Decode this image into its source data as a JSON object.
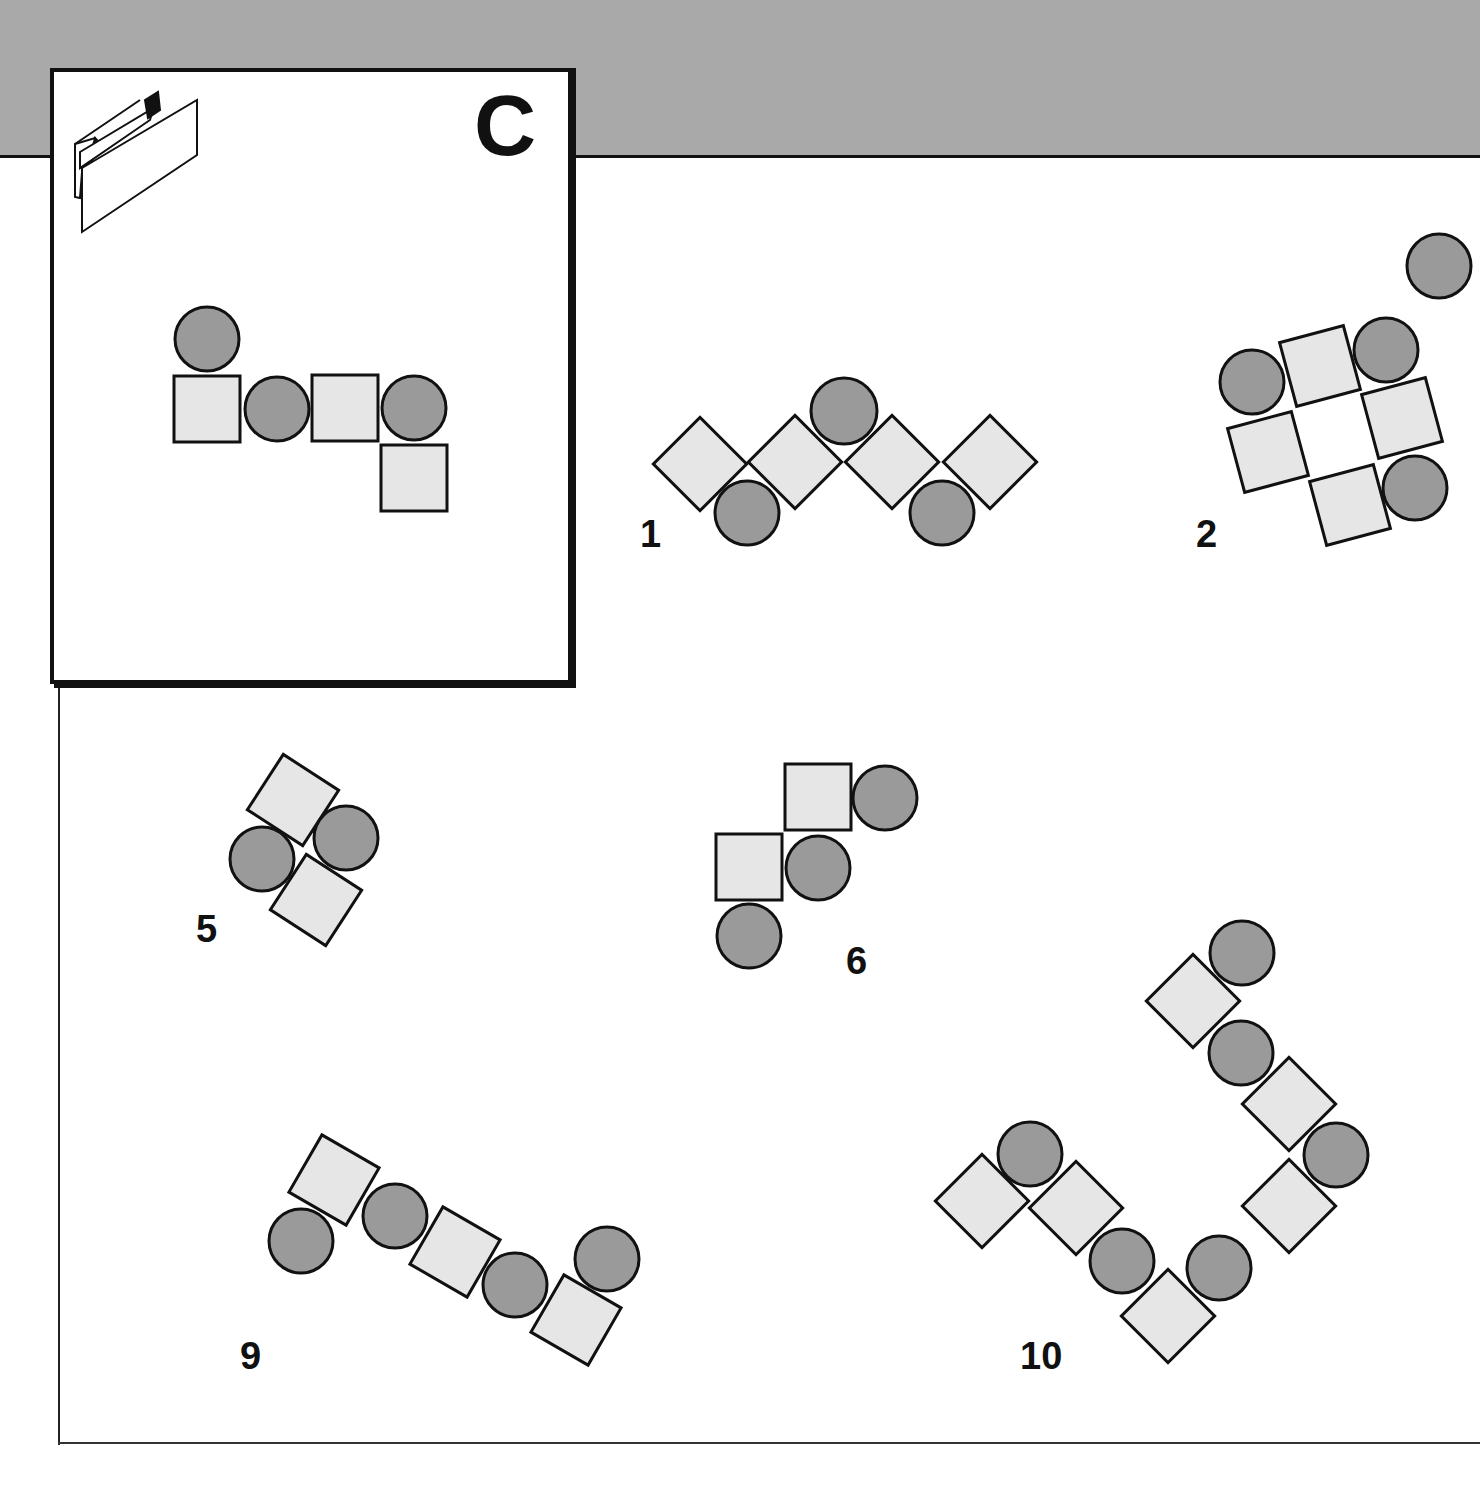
{
  "card": {
    "letter": "C",
    "fold_icon": "folded-paper-icon"
  },
  "colors": {
    "band": "#a9a9a9",
    "square_fill": "#e6e6e6",
    "circle_fill": "#9a9a9a",
    "stroke": "#111111"
  },
  "reference": {
    "shapes": [
      {
        "type": "circle",
        "cx": 207,
        "cy": 339,
        "r": 32
      },
      {
        "type": "square",
        "cx": 207,
        "cy": 409,
        "s": 66,
        "rot": 0
      },
      {
        "type": "circle",
        "cx": 277,
        "cy": 409,
        "r": 32
      },
      {
        "type": "square",
        "cx": 345,
        "cy": 408,
        "s": 66,
        "rot": 0
      },
      {
        "type": "circle",
        "cx": 414,
        "cy": 408,
        "r": 32
      },
      {
        "type": "square",
        "cx": 414,
        "cy": 478,
        "s": 66,
        "rot": 0
      }
    ]
  },
  "options": [
    {
      "label": "1",
      "label_x": 640,
      "label_y": 515,
      "shapes": [
        {
          "type": "square",
          "cx": 700,
          "cy": 464,
          "s": 66,
          "rot": 45
        },
        {
          "type": "circle",
          "cx": 747,
          "cy": 513,
          "r": 32
        },
        {
          "type": "square",
          "cx": 795,
          "cy": 462,
          "s": 66,
          "rot": 45
        },
        {
          "type": "circle",
          "cx": 844,
          "cy": 411,
          "r": 33
        },
        {
          "type": "square",
          "cx": 892,
          "cy": 462,
          "s": 66,
          "rot": 45
        },
        {
          "type": "circle",
          "cx": 942,
          "cy": 513,
          "r": 32
        },
        {
          "type": "square",
          "cx": 990,
          "cy": 462,
          "s": 66,
          "rot": 45
        }
      ]
    },
    {
      "label": "2",
      "label_x": 1196,
      "label_y": 515,
      "shapes": [
        {
          "type": "circle",
          "cx": 1439,
          "cy": 266,
          "r": 32
        },
        {
          "type": "circle",
          "cx": 1252,
          "cy": 382,
          "r": 32
        },
        {
          "type": "square",
          "cx": 1320,
          "cy": 366,
          "s": 66,
          "rot": -15
        },
        {
          "type": "circle",
          "cx": 1386,
          "cy": 350,
          "r": 32
        },
        {
          "type": "square",
          "cx": 1268,
          "cy": 452,
          "s": 66,
          "rot": -15
        },
        {
          "type": "square",
          "cx": 1402,
          "cy": 418,
          "s": 66,
          "rot": -15
        },
        {
          "type": "square",
          "cx": 1350,
          "cy": 505,
          "s": 66,
          "rot": -15
        },
        {
          "type": "circle",
          "cx": 1415,
          "cy": 488,
          "r": 32
        }
      ]
    },
    {
      "label": "5",
      "label_x": 196,
      "label_y": 910,
      "shapes": [
        {
          "type": "square",
          "cx": 293,
          "cy": 800,
          "s": 66,
          "rot": 33
        },
        {
          "type": "circle",
          "cx": 346,
          "cy": 838,
          "r": 32
        },
        {
          "type": "circle",
          "cx": 262,
          "cy": 859,
          "r": 32
        },
        {
          "type": "square",
          "cx": 316,
          "cy": 900,
          "s": 66,
          "rot": 33
        }
      ]
    },
    {
      "label": "6",
      "label_x": 846,
      "label_y": 942,
      "shapes": [
        {
          "type": "square",
          "cx": 818,
          "cy": 797,
          "s": 66,
          "rot": 0
        },
        {
          "type": "circle",
          "cx": 885,
          "cy": 798,
          "r": 32
        },
        {
          "type": "square",
          "cx": 749,
          "cy": 867,
          "s": 66,
          "rot": 0
        },
        {
          "type": "circle",
          "cx": 818,
          "cy": 868,
          "r": 32
        },
        {
          "type": "circle",
          "cx": 749,
          "cy": 936,
          "r": 32
        }
      ]
    },
    {
      "label": "9",
      "label_x": 240,
      "label_y": 1337,
      "shapes": [
        {
          "type": "square",
          "cx": 334,
          "cy": 1180,
          "s": 66,
          "rot": 30
        },
        {
          "type": "circle",
          "cx": 301,
          "cy": 1241,
          "r": 32
        },
        {
          "type": "circle",
          "cx": 395,
          "cy": 1216,
          "r": 32
        },
        {
          "type": "square",
          "cx": 455,
          "cy": 1252,
          "s": 66,
          "rot": 30
        },
        {
          "type": "circle",
          "cx": 515,
          "cy": 1285,
          "r": 32
        },
        {
          "type": "circle",
          "cx": 607,
          "cy": 1259,
          "r": 32
        },
        {
          "type": "square",
          "cx": 576,
          "cy": 1320,
          "s": 66,
          "rot": 30
        }
      ]
    },
    {
      "label": "10",
      "label_x": 1020,
      "label_y": 1337,
      "shapes": [
        {
          "type": "circle",
          "cx": 1242,
          "cy": 953,
          "r": 32
        },
        {
          "type": "square",
          "cx": 1193,
          "cy": 1001,
          "s": 66,
          "rot": 45
        },
        {
          "type": "circle",
          "cx": 1241,
          "cy": 1053,
          "r": 32
        },
        {
          "type": "square",
          "cx": 1289,
          "cy": 1104,
          "s": 66,
          "rot": 45
        },
        {
          "type": "circle",
          "cx": 1336,
          "cy": 1155,
          "r": 32
        },
        {
          "type": "square",
          "cx": 1289,
          "cy": 1206,
          "s": 66,
          "rot": 45
        },
        {
          "type": "circle",
          "cx": 1030,
          "cy": 1154,
          "r": 32
        },
        {
          "type": "square",
          "cx": 982,
          "cy": 1201,
          "s": 66,
          "rot": 45
        },
        {
          "type": "square",
          "cx": 1076,
          "cy": 1208,
          "s": 66,
          "rot": 45
        },
        {
          "type": "circle",
          "cx": 1122,
          "cy": 1261,
          "r": 32
        },
        {
          "type": "circle",
          "cx": 1219,
          "cy": 1268,
          "r": 32
        },
        {
          "type": "square",
          "cx": 1168,
          "cy": 1316,
          "s": 66,
          "rot": 45
        }
      ]
    }
  ]
}
